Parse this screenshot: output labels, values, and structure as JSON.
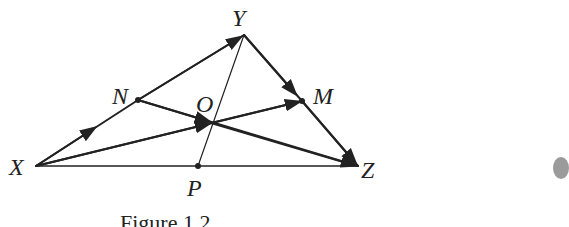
{
  "figure": {
    "points": {
      "X": {
        "label": "X",
        "x": 36,
        "y": 166
      },
      "Y": {
        "label": "Y",
        "x": 244,
        "y": 35
      },
      "Z": {
        "label": "Z",
        "x": 358,
        "y": 166
      },
      "N": {
        "label": "N",
        "x": 138,
        "y": 100
      },
      "M": {
        "label": "M",
        "x": 302,
        "y": 101
      },
      "O": {
        "label": "O",
        "x": 211,
        "y": 123
      },
      "P": {
        "label": "P",
        "x": 198,
        "y": 166
      }
    },
    "caption": "Figure 1.2",
    "line_color": "#222222"
  }
}
